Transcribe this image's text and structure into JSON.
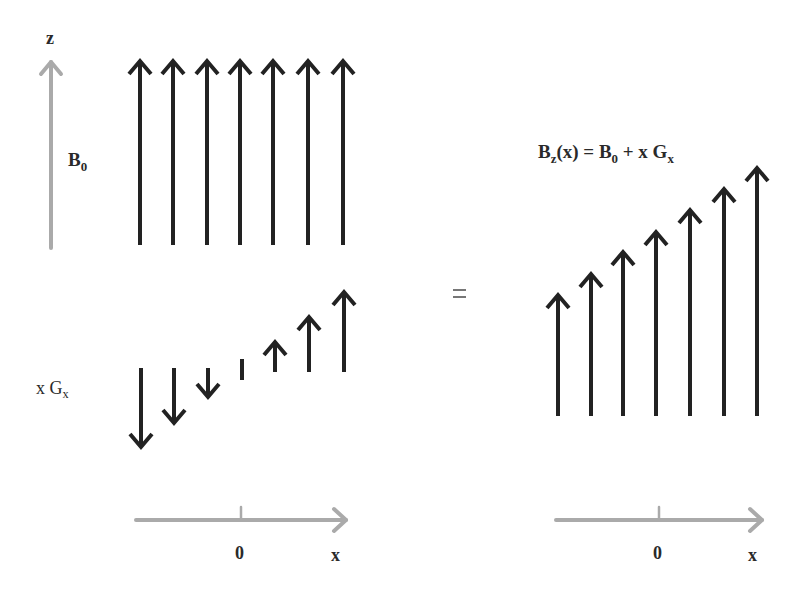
{
  "labels": {
    "z_axis": "z",
    "b0_main": "B",
    "b0_sub": "0",
    "xgx_pre": "x G",
    "xgx_sub": "x",
    "equals": "=",
    "formula": {
      "b": "B",
      "b_sub": "z",
      "mid": "(x) = B",
      "b0_sub": "0",
      "tail": " + x G",
      "gx_sub": "x"
    },
    "left_axis_zero": "0",
    "left_axis_x": "x",
    "right_axis_zero": "0",
    "right_axis_x": "x"
  },
  "colors": {
    "arrow": "#222222",
    "axis": "#aaaaaa",
    "text": "#2a2a2a"
  },
  "diagram": {
    "panels": [
      {
        "name": "uniform-field-B0",
        "arrows": 7,
        "direction": "up",
        "relative_length": [
          1,
          1,
          1,
          1,
          1,
          1,
          1
        ]
      },
      {
        "name": "gradient-field-xGx",
        "arrows": 7,
        "relative_value": [
          -3,
          -2,
          -1,
          0,
          1,
          2,
          3
        ]
      },
      {
        "name": "total-field-Bz",
        "arrows": 7,
        "relative_length": [
          4,
          5,
          6,
          7,
          8,
          9,
          10
        ]
      }
    ]
  }
}
